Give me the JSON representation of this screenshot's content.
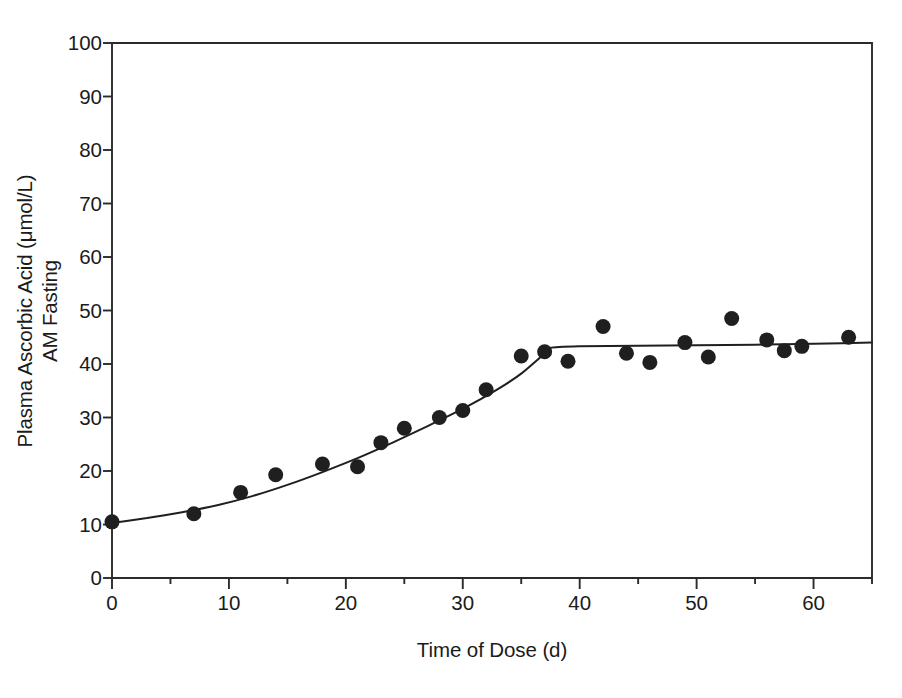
{
  "chart_data": {
    "type": "scatter",
    "title": "",
    "xlabel": "Time of Dose (d)",
    "ylabel_line1": "Plasma Ascorbic Acid (μmol/L)",
    "ylabel_line2": "AM Fasting",
    "xlim": [
      0,
      65
    ],
    "ylim": [
      0,
      100
    ],
    "xticks": [
      0,
      10,
      20,
      30,
      40,
      50,
      60
    ],
    "xtick_labels": [
      "0",
      "10",
      "20",
      "30",
      "40",
      "50",
      "60"
    ],
    "yticks": [
      0,
      10,
      20,
      30,
      40,
      50,
      60,
      70,
      80,
      90,
      100
    ],
    "ytick_labels": [
      "0",
      "10",
      "20",
      "30",
      "40",
      "50",
      "60",
      "70",
      "80",
      "90",
      "100"
    ],
    "x_minor_tick_interval": 5,
    "grid": false,
    "legend": null,
    "marker": {
      "shape": "filled-circle",
      "color": "#1f1f1f",
      "size_px": 15
    },
    "fit_line": {
      "name": "fitted curve",
      "color": "#1f1f1f",
      "width_px": 2,
      "description": "rising curve to plateau with breakpoint near 37.5 d",
      "breakpoint": {
        "x": 37.5,
        "y": 43.0
      },
      "plateau_value": 43.6,
      "points": [
        [
          0,
          10.3
        ],
        [
          3,
          11.2
        ],
        [
          6,
          12.3
        ],
        [
          9,
          13.6
        ],
        [
          12,
          15.3
        ],
        [
          15,
          17.4
        ],
        [
          18,
          19.8
        ],
        [
          21,
          22.4
        ],
        [
          24,
          25.3
        ],
        [
          27,
          28.4
        ],
        [
          30,
          31.6
        ],
        [
          33,
          35.3
        ],
        [
          35,
          38.2
        ],
        [
          36.5,
          41.0
        ],
        [
          37.5,
          43.0
        ],
        [
          40,
          43.3
        ],
        [
          45,
          43.4
        ],
        [
          50,
          43.5
        ],
        [
          55,
          43.6
        ],
        [
          60,
          43.8
        ],
        [
          65,
          44.0
        ]
      ]
    },
    "series": [
      {
        "name": "Plasma ascorbic acid, AM fasting",
        "points": [
          [
            0,
            10.5
          ],
          [
            7,
            12.0
          ],
          [
            11,
            16.0
          ],
          [
            14,
            19.3
          ],
          [
            18,
            21.3
          ],
          [
            21,
            20.8
          ],
          [
            23,
            25.3
          ],
          [
            25,
            28.0
          ],
          [
            28,
            30.0
          ],
          [
            30,
            31.3
          ],
          [
            32,
            35.2
          ],
          [
            35,
            41.5
          ],
          [
            37,
            42.3
          ],
          [
            39,
            40.5
          ],
          [
            42,
            47.0
          ],
          [
            44,
            42.0
          ],
          [
            46,
            40.3
          ],
          [
            49,
            44.0
          ],
          [
            51,
            41.3
          ],
          [
            53,
            48.5
          ],
          [
            56,
            44.5
          ],
          [
            57.5,
            42.5
          ],
          [
            59,
            43.3
          ],
          [
            63,
            45.0
          ]
        ]
      }
    ]
  },
  "axes_pixel_frame": {
    "left": 112,
    "right": 872,
    "top": 43,
    "bottom": 578
  }
}
